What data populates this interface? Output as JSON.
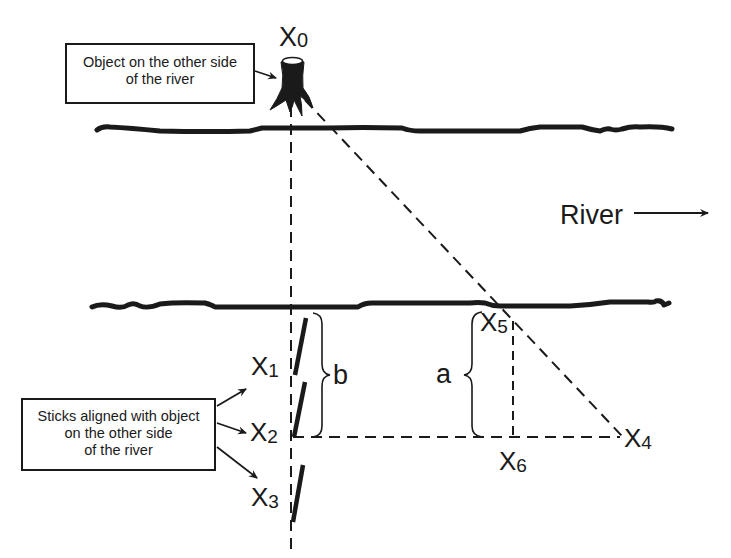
{
  "diagram": {
    "type": "river-width-measurement",
    "callouts": {
      "object": {
        "lines": [
          "Object on the other side",
          "of the river"
        ]
      },
      "sticks": {
        "lines": [
          "Sticks aligned with object",
          "on the other side",
          "of the river"
        ]
      }
    },
    "river_label": "River",
    "points": {
      "x0": {
        "base": "X",
        "sub": "0"
      },
      "x1": {
        "base": "X",
        "sub": "1"
      },
      "x2": {
        "base": "X",
        "sub": "2"
      },
      "x3": {
        "base": "X",
        "sub": "3"
      },
      "x4": {
        "base": "X",
        "sub": "4"
      },
      "x5": {
        "base": "X",
        "sub": "5"
      },
      "x6": {
        "base": "X",
        "sub": "6"
      }
    },
    "distances": {
      "a": "a",
      "b": "b"
    },
    "colors": {
      "ink": "#1a1a1a",
      "background": "#ffffff"
    }
  }
}
